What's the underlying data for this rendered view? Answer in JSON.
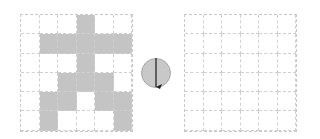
{
  "left_grid": {
    "rows": 6,
    "cols": 6,
    "filled": [
      [
        0,
        0,
        0,
        1,
        0,
        0
      ],
      [
        0,
        1,
        1,
        1,
        1,
        1
      ],
      [
        0,
        0,
        0,
        1,
        0,
        0
      ],
      [
        0,
        0,
        1,
        1,
        1,
        0
      ],
      [
        0,
        1,
        1,
        0,
        1,
        1
      ],
      [
        0,
        1,
        0,
        0,
        0,
        1
      ]
    ],
    "fill_color": "#c4c4c4"
  },
  "rotation_icon": {
    "semantic": "rotate-icon",
    "direction": "clockwise-half-turn"
  },
  "right_grid": {
    "rows": 6,
    "cols": 6,
    "filled": [
      [
        0,
        0,
        0,
        0,
        0,
        0
      ],
      [
        0,
        0,
        0,
        0,
        0,
        0
      ],
      [
        0,
        0,
        0,
        0,
        0,
        0
      ],
      [
        0,
        0,
        0,
        0,
        0,
        0
      ],
      [
        0,
        0,
        0,
        0,
        0,
        0
      ],
      [
        0,
        0,
        0,
        0,
        0,
        0
      ]
    ]
  }
}
